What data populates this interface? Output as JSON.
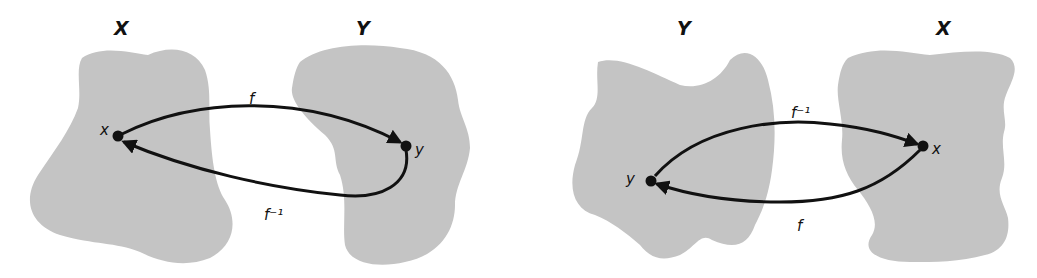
{
  "diagram": {
    "colors": {
      "region": "#c4c4c4",
      "ink": "#111111",
      "background": "#ffffff"
    },
    "left_panel": {
      "set_left_label": "X",
      "set_right_label": "Y",
      "point_left_label": "x",
      "point_right_label": "y",
      "top_arrow_label": "f",
      "top_arrow_direction": "x → y",
      "bottom_arrow_label": "f⁻¹",
      "bottom_arrow_direction": "y → x"
    },
    "right_panel": {
      "set_left_label": "Y",
      "set_right_label": "X",
      "point_left_label": "y",
      "point_right_label": "x",
      "top_arrow_label": "f⁻¹",
      "top_arrow_direction": "y → x",
      "bottom_arrow_label": "f",
      "bottom_arrow_direction": "x → y"
    }
  }
}
